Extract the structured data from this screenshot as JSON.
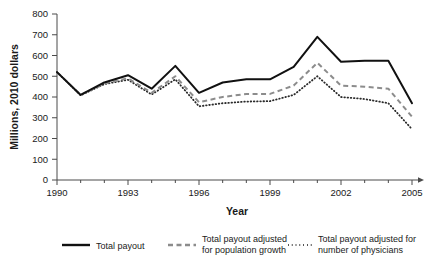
{
  "chart_data": {
    "type": "line",
    "title": "",
    "xlabel": "Year",
    "ylabel": "Millions, 2010 dollars",
    "x": [
      1990,
      1991,
      1992,
      1993,
      1994,
      1995,
      1996,
      1997,
      1998,
      1999,
      2000,
      2001,
      2002,
      2003,
      2004,
      2005
    ],
    "xlim": [
      1990,
      2005
    ],
    "ylim": [
      0,
      800
    ],
    "xticks": [
      1990,
      1993,
      1996,
      1999,
      2002,
      2005
    ],
    "xtick_labels": [
      "1990",
      "1993",
      "1996",
      "1999",
      "2002",
      "2005"
    ],
    "yticks": [
      0,
      100,
      200,
      300,
      400,
      500,
      600,
      700,
      800
    ],
    "ytick_labels": [
      "0",
      "100",
      "200",
      "300",
      "400",
      "500",
      "600",
      "700",
      "800"
    ],
    "grid": false,
    "legend_position": "bottom",
    "series": [
      {
        "name": "Total payout",
        "style": "solid",
        "color": "#111111",
        "values": [
          520,
          410,
          470,
          505,
          440,
          550,
          420,
          470,
          485,
          485,
          545,
          690,
          570,
          575,
          575,
          370
        ]
      },
      {
        "name": "Total payout adjusted for population growth",
        "style": "dashed",
        "color": "#8c8c8c",
        "values": [
          520,
          410,
          465,
          490,
          420,
          500,
          375,
          400,
          415,
          415,
          455,
          565,
          455,
          450,
          440,
          305
        ]
      },
      {
        "name": "Total payout adjusted for number of physicians",
        "style": "dotted",
        "color": "#2b2b2b",
        "values": [
          520,
          408,
          462,
          483,
          412,
          485,
          355,
          370,
          378,
          380,
          410,
          500,
          400,
          390,
          370,
          245
        ]
      }
    ]
  },
  "legend": {
    "items": [
      {
        "label": "Total payout",
        "style": "solid"
      },
      {
        "label": "Total payout adjusted\nfor population growth",
        "line1": "Total payout adjusted",
        "line2": "for population growth",
        "style": "dashed"
      },
      {
        "label": "Total payout adjusted for\nnumber of physicians",
        "line1": "Total payout adjusted for",
        "line2": "number of physicians",
        "style": "dotted"
      }
    ]
  }
}
